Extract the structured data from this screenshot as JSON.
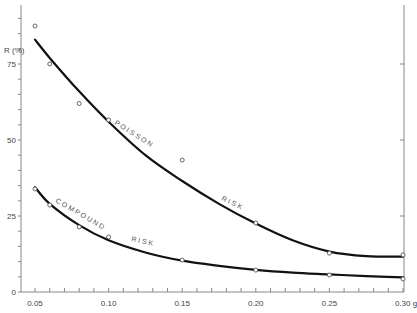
{
  "chart_data": {
    "type": "line",
    "title": "",
    "xlabel": "g",
    "ylabel": "R (%)",
    "xlim": [
      0.05,
      0.3
    ],
    "ylim": [
      0,
      95
    ],
    "grid": false,
    "legend": "none (curves labelled inline)",
    "x_ticks": [
      0.05,
      0.1,
      0.15,
      0.2,
      0.25,
      0.3
    ],
    "x_tick_labels": [
      "0.05",
      "0.10",
      "0.15",
      "0.20",
      "0.25",
      "0.30 g"
    ],
    "y_ticks": [
      0,
      25,
      50,
      75
    ],
    "y_tick_labels": [
      "0",
      "25",
      "50",
      "75"
    ],
    "series": [
      {
        "name": "POISSON RISK",
        "points": [
          {
            "x": 0.05,
            "y": 87.5
          },
          {
            "x": 0.06,
            "y": 75.0
          },
          {
            "x": 0.08,
            "y": 62.0
          },
          {
            "x": 0.1,
            "y": 56.6
          },
          {
            "x": 0.15,
            "y": 43.4
          },
          {
            "x": 0.2,
            "y": 22.7
          },
          {
            "x": 0.25,
            "y": 12.8
          },
          {
            "x": 0.3,
            "y": 12.2
          }
        ],
        "fit_curve": [
          {
            "x": 0.05,
            "y": 83.0
          },
          {
            "x": 0.06,
            "y": 77.0
          },
          {
            "x": 0.08,
            "y": 66.0
          },
          {
            "x": 0.1,
            "y": 56.0
          },
          {
            "x": 0.125,
            "y": 45.0
          },
          {
            "x": 0.15,
            "y": 36.5
          },
          {
            "x": 0.175,
            "y": 29.0
          },
          {
            "x": 0.2,
            "y": 22.5
          },
          {
            "x": 0.225,
            "y": 17.0
          },
          {
            "x": 0.25,
            "y": 13.3
          },
          {
            "x": 0.275,
            "y": 11.8
          },
          {
            "x": 0.3,
            "y": 11.6
          }
        ]
      },
      {
        "name": "COMPOUND RISK",
        "points": [
          {
            "x": 0.05,
            "y": 33.9
          },
          {
            "x": 0.06,
            "y": 28.6
          },
          {
            "x": 0.08,
            "y": 21.4
          },
          {
            "x": 0.1,
            "y": 18.1
          },
          {
            "x": 0.15,
            "y": 10.5
          },
          {
            "x": 0.2,
            "y": 7.2
          },
          {
            "x": 0.25,
            "y": 5.6
          },
          {
            "x": 0.3,
            "y": 4.3
          }
        ],
        "fit_curve": [
          {
            "x": 0.05,
            "y": 34.5
          },
          {
            "x": 0.06,
            "y": 29.0
          },
          {
            "x": 0.08,
            "y": 22.0
          },
          {
            "x": 0.1,
            "y": 17.0
          },
          {
            "x": 0.125,
            "y": 13.0
          },
          {
            "x": 0.15,
            "y": 10.3
          },
          {
            "x": 0.175,
            "y": 8.6
          },
          {
            "x": 0.2,
            "y": 7.3
          },
          {
            "x": 0.225,
            "y": 6.4
          },
          {
            "x": 0.25,
            "y": 5.8
          },
          {
            "x": 0.275,
            "y": 5.2
          },
          {
            "x": 0.3,
            "y": 4.8
          }
        ]
      }
    ],
    "annotations": [
      {
        "text": "POISSON",
        "series": "POISSON RISK",
        "near_x": 0.12
      },
      {
        "text": "RISK",
        "series": "POISSON RISK",
        "near_x": 0.19
      },
      {
        "text": "COMPOUND",
        "series": "COMPOUND RISK",
        "near_x": 0.075
      },
      {
        "text": "RISK",
        "series": "COMPOUND RISK",
        "near_x": 0.125
      }
    ]
  },
  "labels": {
    "y_axis_title": "R (%)",
    "poisson_word1": "P O I S S O N",
    "poisson_word2": "R I S K",
    "compound_word1": "C O M P O U N D",
    "compound_word2": "R I S K"
  },
  "colors": {
    "curve": "#111111",
    "axis": "#888888",
    "marker": "#555555",
    "text": "#444444"
  }
}
